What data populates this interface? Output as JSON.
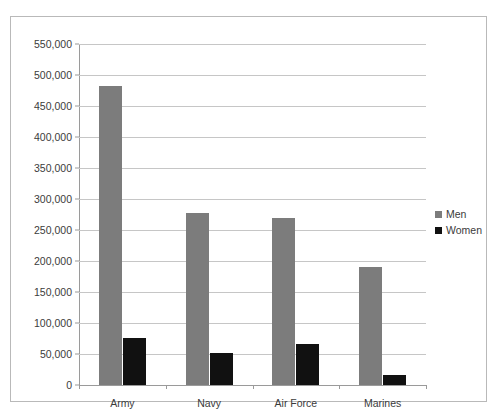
{
  "chart_data": {
    "type": "bar",
    "title": "",
    "xlabel": "",
    "ylabel": "",
    "categories": [
      "Army",
      "Navy",
      "Air Force",
      "Marines"
    ],
    "series": [
      {
        "name": "Men",
        "color": "#7c7c7c",
        "values": [
          482000,
          277000,
          269000,
          190000
        ]
      },
      {
        "name": "Women",
        "color": "#111111",
        "values": [
          76000,
          52000,
          66000,
          16000
        ]
      }
    ],
    "ylim": [
      0,
      550000
    ],
    "y_tick_step": 50000,
    "y_ticks": [
      0,
      50000,
      100000,
      150000,
      200000,
      250000,
      300000,
      350000,
      400000,
      450000,
      500000,
      550000
    ],
    "y_tick_labels": [
      "0",
      "50,000",
      "100,000",
      "150,000",
      "200,000",
      "250,000",
      "300,000",
      "350,000",
      "400,000",
      "450,000",
      "500,000",
      "550,000"
    ],
    "grid": true,
    "legend_position": "right",
    "legend_entries": [
      "Men",
      "Women"
    ]
  },
  "frame": {
    "border_color": "#b9b9b9"
  }
}
